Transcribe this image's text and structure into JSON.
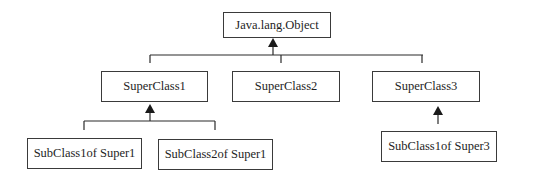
{
  "diagram": {
    "type": "class-hierarchy",
    "root": {
      "id": "object",
      "label": "Java.lang.Object"
    },
    "nodes": [
      {
        "id": "object",
        "label": "Java.lang.Object",
        "x": 223,
        "y": 12,
        "w": 108,
        "h": 26
      },
      {
        "id": "super1",
        "label": "SuperClass1",
        "x": 101,
        "y": 71,
        "w": 107,
        "h": 31
      },
      {
        "id": "super2",
        "label": "SuperClass2",
        "x": 232,
        "y": 71,
        "w": 108,
        "h": 31
      },
      {
        "id": "super3",
        "label": "SuperClass3",
        "x": 372,
        "y": 71,
        "w": 108,
        "h": 31
      },
      {
        "id": "sub1of1",
        "label": "SubClass1of Super1",
        "x": 27,
        "y": 138,
        "w": 115,
        "h": 31
      },
      {
        "id": "sub2of1",
        "label": "SubClass2of Super1",
        "x": 158,
        "y": 139,
        "w": 115,
        "h": 31
      },
      {
        "id": "sub1of3",
        "label": "SubClass1of Super3",
        "x": 381,
        "y": 131,
        "w": 116,
        "h": 31
      }
    ],
    "edges": [
      {
        "from": "super1",
        "to": "object",
        "kind": "inheritance"
      },
      {
        "from": "super2",
        "to": "object",
        "kind": "inheritance"
      },
      {
        "from": "super3",
        "to": "object",
        "kind": "inheritance"
      },
      {
        "from": "sub1of1",
        "to": "super1",
        "kind": "inheritance"
      },
      {
        "from": "sub2of1",
        "to": "super1",
        "kind": "inheritance"
      },
      {
        "from": "sub1of3",
        "to": "super3",
        "kind": "inheritance"
      }
    ],
    "colors": {
      "line": "#2a2a2a",
      "border": "#3a3a3a",
      "text": "#1e1e1e",
      "background": "#ffffff"
    }
  }
}
